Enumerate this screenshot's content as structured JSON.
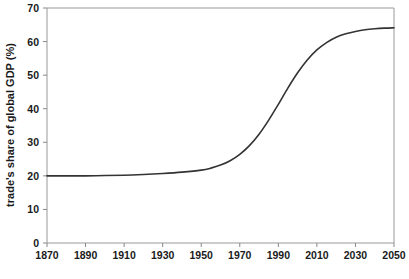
{
  "chart_data": {
    "type": "line",
    "title": "",
    "xlabel": "",
    "ylabel": "trade's share of global GDP (%)",
    "xlim": [
      1870,
      2050
    ],
    "ylim": [
      0,
      70
    ],
    "grid": false,
    "legend": "none",
    "xticks": [
      1870,
      1890,
      1910,
      1930,
      1950,
      1970,
      1990,
      2010,
      2030,
      2050
    ],
    "xtick_labels": [
      "1870",
      "1890",
      "1910",
      "1930",
      "1950",
      "1970",
      "1990",
      "2010",
      "2030",
      "2050"
    ],
    "yticks": [
      0,
      10,
      20,
      30,
      40,
      50,
      60,
      70
    ],
    "ytick_labels": [
      "0",
      "10",
      "20",
      "30",
      "40",
      "50",
      "60",
      "70"
    ],
    "series": [
      {
        "name": "trade's share of global GDP",
        "color": "#333333",
        "x": [
          1870,
          1880,
          1890,
          1900,
          1910,
          1920,
          1930,
          1940,
          1950,
          1955,
          1960,
          1965,
          1970,
          1975,
          1980,
          1985,
          1990,
          1995,
          2000,
          2005,
          2010,
          2015,
          2020,
          2025,
          2030,
          2035,
          2040,
          2045,
          2050
        ],
        "values": [
          20.0,
          20.0,
          20.0,
          20.1,
          20.2,
          20.4,
          20.7,
          21.1,
          21.7,
          22.3,
          23.2,
          24.5,
          26.4,
          29.0,
          32.4,
          36.6,
          41.3,
          46.2,
          50.7,
          54.5,
          57.5,
          59.7,
          61.3,
          62.3,
          63.0,
          63.5,
          63.8,
          64.0,
          64.1
        ]
      }
    ],
    "annotations": []
  },
  "geometry": {
    "plot_left": 47,
    "plot_right": 394,
    "plot_top": 8,
    "plot_bottom": 243
  },
  "style": {
    "line_color": "#333333",
    "frame_color": "#999999",
    "tick_color": "#888888",
    "text_color": "#1a1a1a",
    "background": "#ffffff"
  }
}
